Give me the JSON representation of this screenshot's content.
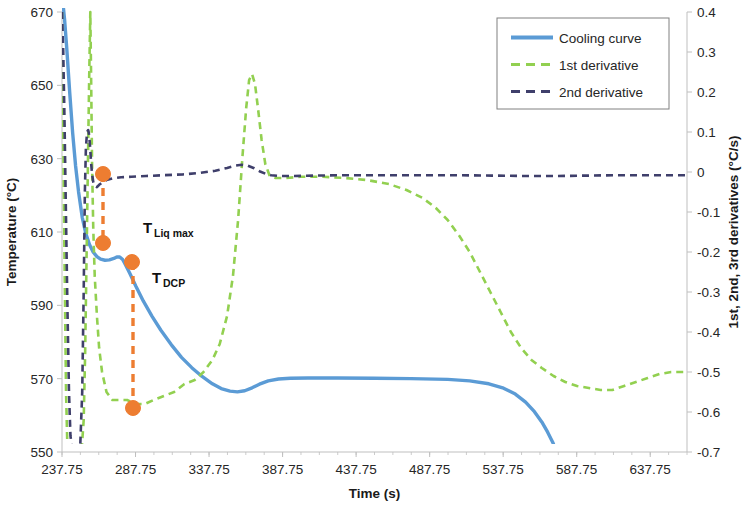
{
  "chart_data": {
    "type": "line",
    "title": "",
    "xlabel": "Time (s)",
    "ylabel": "Temperature (°C)",
    "y2label": "1st, 2nd, 3rd derivatives (°C/s)",
    "xlim": [
      237.75,
      662.75
    ],
    "ylim": [
      550,
      670
    ],
    "y2lim": [
      -0.7,
      0.4
    ],
    "grid": false,
    "legend_position": "top-right",
    "xticks": [
      "237.75",
      "287.75",
      "337.75",
      "387.75",
      "437.75",
      "487.75",
      "537.75",
      "587.75",
      "637.75"
    ],
    "xtick_values": [
      237.75,
      287.75,
      337.75,
      387.75,
      437.75,
      487.75,
      537.75,
      587.75,
      637.75
    ],
    "yticks": [
      "550",
      "570",
      "590",
      "610",
      "630",
      "650",
      "670"
    ],
    "ytick_values": [
      550,
      570,
      590,
      610,
      630,
      650,
      670
    ],
    "y2ticks": [
      "0.4",
      "0.3",
      "0.2",
      "0.1",
      "0",
      "-0.1",
      "-0.2",
      "-0.3",
      "-0.4",
      "-0.5",
      "-0.6",
      "-0.7"
    ],
    "y2tick_values": [
      0.4,
      0.3,
      0.2,
      0.1,
      0,
      -0.1,
      -0.2,
      -0.3,
      -0.4,
      -0.5,
      -0.6,
      -0.7
    ],
    "colors": {
      "cooling_curve": "#5B9BD5",
      "first_derivative": "#92D050",
      "second_derivative": "#3F3F6B",
      "marker": "#ED7D31",
      "axis": "#BFBFBF",
      "text": "#262626"
    },
    "series": [
      {
        "name": "Cooling curve",
        "axis": "left",
        "style": "solid",
        "color": "#5B9BD5",
        "points": [
          [
            237.75,
            680.0
          ],
          [
            238.5,
            672.0
          ],
          [
            239.5,
            668.0
          ],
          [
            241.0,
            660.0
          ],
          [
            243.0,
            648.0
          ],
          [
            245.0,
            637.0
          ],
          [
            247.0,
            628.0
          ],
          [
            249.0,
            621.0
          ],
          [
            251.5,
            614.0
          ],
          [
            254.0,
            609.5
          ],
          [
            256.5,
            606.5
          ],
          [
            259.0,
            604.5
          ],
          [
            261.5,
            603.3
          ],
          [
            264.0,
            602.6
          ],
          [
            267.0,
            602.3
          ],
          [
            270.0,
            602.4
          ],
          [
            273.0,
            602.8
          ],
          [
            275.0,
            603.2
          ],
          [
            277.0,
            603.2
          ],
          [
            279.0,
            602.5
          ],
          [
            281.0,
            601.0
          ],
          [
            284.0,
            598.6
          ],
          [
            288.0,
            595.2
          ],
          [
            293.0,
            591.2
          ],
          [
            299.0,
            587.0
          ],
          [
            305.0,
            583.2
          ],
          [
            312.0,
            579.3
          ],
          [
            319.0,
            575.8
          ],
          [
            326.0,
            573.0
          ],
          [
            333.0,
            570.6
          ],
          [
            340.0,
            568.6
          ],
          [
            346.0,
            567.3
          ],
          [
            352.0,
            566.6
          ],
          [
            357.0,
            566.4
          ],
          [
            362.0,
            566.7
          ],
          [
            367.0,
            567.5
          ],
          [
            372.0,
            568.5
          ],
          [
            378.0,
            569.4
          ],
          [
            385.0,
            569.9
          ],
          [
            393.0,
            570.1
          ],
          [
            405.0,
            570.2
          ],
          [
            425.0,
            570.2
          ],
          [
            450.0,
            570.1
          ],
          [
            475.0,
            570.0
          ],
          [
            500.0,
            569.8
          ],
          [
            515.0,
            569.4
          ],
          [
            528.0,
            568.6
          ],
          [
            538.0,
            567.4
          ],
          [
            546.0,
            565.8
          ],
          [
            553.0,
            563.6
          ],
          [
            559.0,
            561.0
          ],
          [
            564.0,
            558.2
          ],
          [
            568.0,
            555.4
          ],
          [
            571.5,
            552.6
          ],
          [
            574.0,
            550.0
          ]
        ]
      },
      {
        "name": "1st derivative",
        "axis": "right",
        "style": "dashed",
        "color": "#92D050",
        "points": [
          [
            237.75,
            0.4
          ],
          [
            238.6,
            0.1
          ],
          [
            239.4,
            -0.2
          ],
          [
            240.5,
            -0.55
          ],
          [
            241.5,
            -0.7
          ],
          [
            243.0,
            -0.7
          ],
          [
            246.0,
            -0.7
          ],
          [
            249.0,
            -0.7
          ],
          [
            251.0,
            -0.7
          ],
          [
            252.5,
            -0.62
          ],
          [
            253.5,
            -0.45
          ],
          [
            254.5,
            -0.2
          ],
          [
            255.5,
            0.05
          ],
          [
            256.3,
            0.25
          ],
          [
            257.0,
            0.4
          ],
          [
            257.6,
            0.22
          ],
          [
            258.2,
            0.02
          ],
          [
            259.0,
            -0.14
          ],
          [
            260.0,
            -0.26
          ],
          [
            261.5,
            -0.36
          ],
          [
            263.0,
            -0.44
          ],
          [
            265.0,
            -0.5
          ],
          [
            268.0,
            -0.55
          ],
          [
            272.0,
            -0.57
          ],
          [
            277.0,
            -0.57
          ],
          [
            282.0,
            -0.57
          ],
          [
            288.0,
            -0.58
          ],
          [
            294.0,
            -0.58
          ],
          [
            300.0,
            -0.57
          ],
          [
            307.0,
            -0.56
          ],
          [
            314.0,
            -0.55
          ],
          [
            321.0,
            -0.53
          ],
          [
            328.0,
            -0.52
          ],
          [
            334.0,
            -0.5
          ],
          [
            340.0,
            -0.47
          ],
          [
            345.0,
            -0.43
          ],
          [
            350.0,
            -0.36
          ],
          [
            354.0,
            -0.26
          ],
          [
            357.5,
            -0.12
          ],
          [
            360.5,
            0.04
          ],
          [
            363.0,
            0.16
          ],
          [
            365.0,
            0.23
          ],
          [
            367.0,
            0.245
          ],
          [
            369.0,
            0.22
          ],
          [
            371.0,
            0.16
          ],
          [
            373.5,
            0.08
          ],
          [
            376.0,
            0.02
          ],
          [
            379.0,
            -0.01
          ],
          [
            383.0,
            -0.015
          ],
          [
            390.0,
            -0.015
          ],
          [
            400.0,
            -0.012
          ],
          [
            415.0,
            -0.012
          ],
          [
            430.0,
            -0.015
          ],
          [
            445.0,
            -0.02
          ],
          [
            460.0,
            -0.03
          ],
          [
            472.0,
            -0.045
          ],
          [
            483.0,
            -0.065
          ],
          [
            492.0,
            -0.09
          ],
          [
            500.0,
            -0.12
          ],
          [
            508.0,
            -0.16
          ],
          [
            515.0,
            -0.2
          ],
          [
            522.0,
            -0.25
          ],
          [
            529.0,
            -0.3
          ],
          [
            536.0,
            -0.35
          ],
          [
            543.0,
            -0.4
          ],
          [
            550.0,
            -0.44
          ],
          [
            557.0,
            -0.47
          ],
          [
            564.0,
            -0.49
          ],
          [
            572.0,
            -0.51
          ],
          [
            580.0,
            -0.525
          ],
          [
            588.0,
            -0.535
          ],
          [
            596.0,
            -0.54
          ],
          [
            604.0,
            -0.545
          ],
          [
            612.0,
            -0.545
          ],
          [
            620.0,
            -0.535
          ],
          [
            628.0,
            -0.525
          ],
          [
            636.0,
            -0.515
          ],
          [
            644.0,
            -0.505
          ],
          [
            652.0,
            -0.5
          ],
          [
            660.0,
            -0.5
          ],
          [
            662.75,
            -0.5
          ]
        ]
      },
      {
        "name": "2nd derivative",
        "axis": "right",
        "style": "dashed",
        "color": "#3F3F6B",
        "points": [
          [
            237.75,
            0.4
          ],
          [
            238.6,
            0.3
          ],
          [
            239.5,
            0.12
          ],
          [
            240.5,
            -0.12
          ],
          [
            241.5,
            -0.35
          ],
          [
            242.5,
            -0.55
          ],
          [
            243.5,
            -0.66
          ],
          [
            245.0,
            -0.7
          ],
          [
            247.0,
            -0.7
          ],
          [
            250.0,
            -0.7
          ],
          [
            251.5,
            -0.55
          ],
          [
            252.5,
            -0.3
          ],
          [
            253.3,
            -0.05
          ],
          [
            254.0,
            0.06
          ],
          [
            254.8,
            0.1
          ],
          [
            255.6,
            0.105
          ],
          [
            256.3,
            0.09
          ],
          [
            257.0,
            0.055
          ],
          [
            257.6,
            0.02
          ],
          [
            258.2,
            -0.005
          ],
          [
            259.0,
            -0.025
          ],
          [
            260.0,
            -0.035
          ],
          [
            261.5,
            -0.038
          ],
          [
            263.0,
            -0.032
          ],
          [
            265.5,
            -0.025
          ],
          [
            268.0,
            -0.02
          ],
          [
            272.0,
            -0.016
          ],
          [
            278.0,
            -0.013
          ],
          [
            285.0,
            -0.012
          ],
          [
            295.0,
            -0.01
          ],
          [
            307.0,
            -0.008
          ],
          [
            320.0,
            -0.006
          ],
          [
            332.0,
            -0.002
          ],
          [
            342.0,
            0.003
          ],
          [
            350.0,
            0.01
          ],
          [
            356.0,
            0.016
          ],
          [
            360.0,
            0.018
          ],
          [
            364.0,
            0.016
          ],
          [
            368.0,
            0.01
          ],
          [
            372.0,
            0.002
          ],
          [
            376.0,
            -0.004
          ],
          [
            380.0,
            -0.008
          ],
          [
            386.0,
            -0.01
          ],
          [
            395.0,
            -0.01
          ],
          [
            410.0,
            -0.009
          ],
          [
            430.0,
            -0.008
          ],
          [
            455.0,
            -0.008
          ],
          [
            480.0,
            -0.008
          ],
          [
            505.0,
            -0.008
          ],
          [
            530.0,
            -0.009
          ],
          [
            555.0,
            -0.01
          ],
          [
            575.0,
            -0.01
          ],
          [
            595.0,
            -0.009
          ],
          [
            615.0,
            -0.008
          ],
          [
            635.0,
            -0.008
          ],
          [
            655.0,
            -0.008
          ],
          [
            662.75,
            -0.008
          ]
        ]
      }
    ],
    "annotations": [
      {
        "id": "t-liq-max",
        "label_main": "T",
        "label_sub": "Liq max",
        "x": 255.5,
        "y_temp": 604.8,
        "marker_x_px": 103,
        "marker_y_px": 243,
        "text_x_px": 143,
        "text_y_px": 233
      },
      {
        "id": "t-dcp",
        "label_main": "T",
        "label_sub": "DCP",
        "x": 266.5,
        "y_temp": 597.0,
        "marker_x_px": 132,
        "marker_y_px": 262,
        "text_x_px": 152,
        "text_y_px": 283
      }
    ],
    "extra_markers": [
      {
        "id": "marker-second-derivative",
        "marker_x_px": 103,
        "marker_y_px": 174
      },
      {
        "id": "marker-first-derivative-min",
        "marker_x_px": 133,
        "marker_y_px": 408
      }
    ],
    "guide_lines": [
      {
        "id": "guide-liq-max",
        "x_px": 103,
        "y1_px": 174,
        "y2_px": 243
      },
      {
        "id": "guide-dcp",
        "x_px": 133,
        "y1_px": 262,
        "y2_px": 408
      }
    ]
  },
  "legend": {
    "items": [
      {
        "label": "Cooling curve",
        "style": "solid",
        "color": "#5B9BD5"
      },
      {
        "label": "1st derivative",
        "style": "dashed",
        "color": "#92D050"
      },
      {
        "label": "2nd derivative",
        "style": "dashed",
        "color": "#3F3F6B"
      }
    ]
  }
}
